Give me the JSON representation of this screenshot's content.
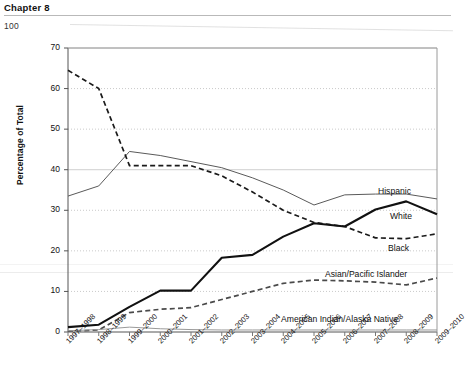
{
  "header": {
    "chapter": "Chapter 8",
    "page_number": "100"
  },
  "chart_data": {
    "type": "line",
    "title": "",
    "xlabel": "",
    "ylabel": "Percentage of Total",
    "ylim": [
      0,
      70
    ],
    "yticks": [
      0,
      10,
      20,
      30,
      40,
      50,
      60,
      70
    ],
    "grid": true,
    "legend_position": "inline-right",
    "categories": [
      "1997–1998",
      "1998–1999",
      "1999–2000",
      "2000–2001",
      "2001–2002",
      "2002–2003",
      "2003–2004",
      "2004–2005",
      "2005–2006",
      "2006–2007",
      "2007–2008",
      "2008–2009",
      "2009–2010"
    ],
    "series": [
      {
        "name": "Hispanic",
        "style": "thin-solid",
        "color": "#5a5a5a",
        "values": [
          33.5,
          36.0,
          44.5,
          43.5,
          42.0,
          40.5,
          38.0,
          35.0,
          31.3,
          33.8,
          34.0,
          34.0,
          32.8
        ]
      },
      {
        "name": "Black",
        "style": "dashed",
        "color": "#1a1a1a",
        "values": [
          64.5,
          60.0,
          41.0,
          41.0,
          41.0,
          38.5,
          34.5,
          30.0,
          27.0,
          26.0,
          23.2,
          23.0,
          24.2
        ]
      },
      {
        "name": "White",
        "style": "bold-solid",
        "color": "#111111",
        "values": [
          1.2,
          1.8,
          6.2,
          10.2,
          10.2,
          18.3,
          19.0,
          23.5,
          26.8,
          26.0,
          30.2,
          32.2,
          29.0
        ]
      },
      {
        "name": "Asian/Pacific Islander",
        "style": "dashed",
        "color": "#4a4a4a",
        "values": [
          0.2,
          0.5,
          4.8,
          5.6,
          6.0,
          8.0,
          10.0,
          12.0,
          12.8,
          12.6,
          12.3,
          11.6,
          13.3
        ]
      },
      {
        "name": "American Indian/Alaska Native",
        "style": "thin-solid-light",
        "color": "#9a9a9a",
        "values": [
          0.3,
          0.6,
          1.2,
          0.8,
          0.6,
          0.5,
          0.5,
          0.5,
          0.5,
          0.5,
          0.5,
          0.5,
          0.5
        ]
      }
    ],
    "series_labels": [
      {
        "name": "Hispanic",
        "x": 378,
        "y": 186
      },
      {
        "name": "White",
        "x": 390,
        "y": 211
      },
      {
        "name": "Black",
        "x": 388,
        "y": 243
      },
      {
        "name": "Asian/Pacific Islander",
        "x": 325,
        "y": 269
      },
      {
        "name": "American Indian/Alaska Native",
        "x": 281,
        "y": 314
      }
    ]
  }
}
